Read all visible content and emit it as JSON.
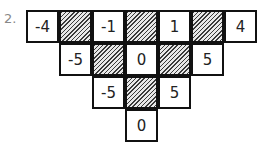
{
  "problem": {
    "number_label": "2.",
    "rows": [
      [
        {
          "value": "-4",
          "shaded": false
        },
        {
          "value": "",
          "shaded": true
        },
        {
          "value": "-1",
          "shaded": false
        },
        {
          "value": "",
          "shaded": true
        },
        {
          "value": "1",
          "shaded": false
        },
        {
          "value": "",
          "shaded": true
        },
        {
          "value": "4",
          "shaded": false
        }
      ],
      [
        {
          "value": "-5",
          "shaded": false
        },
        {
          "value": "",
          "shaded": true
        },
        {
          "value": "0",
          "shaded": false
        },
        {
          "value": "",
          "shaded": true
        },
        {
          "value": "5",
          "shaded": false
        }
      ],
      [
        {
          "value": "-5",
          "shaded": false
        },
        {
          "value": "",
          "shaded": true
        },
        {
          "value": "5",
          "shaded": false
        }
      ],
      [
        {
          "value": "0",
          "shaded": false
        }
      ]
    ]
  }
}
